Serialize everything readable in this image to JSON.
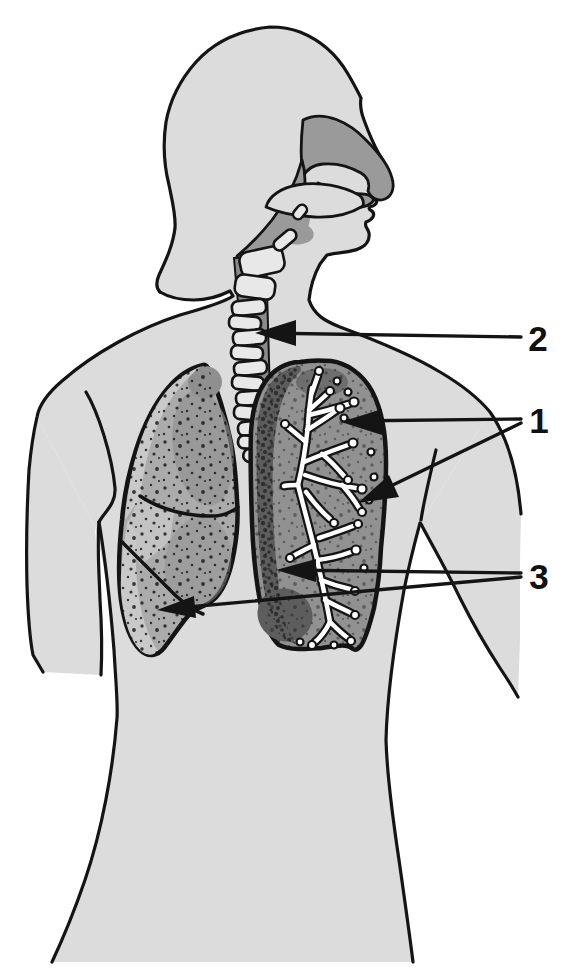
{
  "figure": {
    "kind": "anatomical diagram",
    "labels": [
      {
        "text": "1",
        "points_to": "bronchial tree inside lung cross-section",
        "pointer_count": 2
      },
      {
        "text": "2",
        "points_to": "trachea",
        "pointer_count": 1
      },
      {
        "text": "3",
        "points_to": "lungs (pleural edge and lower lobe fissure)",
        "pointer_count": 2
      }
    ],
    "colors": {
      "background": "#ffffff",
      "outline": "#141414",
      "body": "#dcdcdc",
      "airway": "#9a9a9a",
      "cartilage": "#e8e8e8",
      "lung": "#ababab",
      "lung_highlight": "#c9c9c9",
      "lung_shadow": "#8f8f8f",
      "lung_section": "#919191",
      "lung_section_band": "#5d5d5d",
      "bronchial_tree": "#ffffff",
      "label_text": "#111111"
    }
  }
}
